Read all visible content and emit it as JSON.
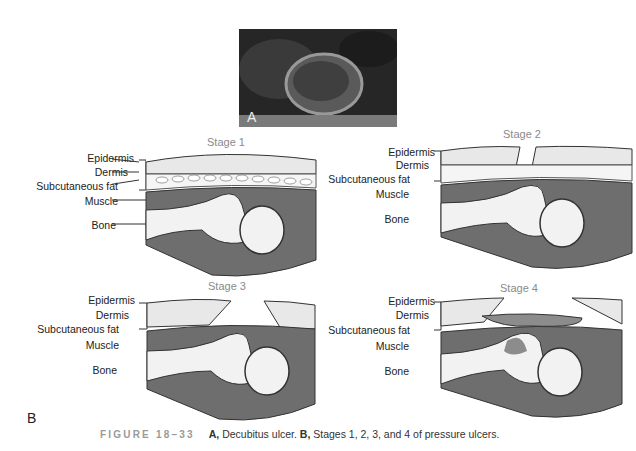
{
  "photo": {
    "label": "A",
    "description": "Decubitus ulcer photograph"
  },
  "stages": [
    {
      "title": "Stage 1"
    },
    {
      "title": "Stage 2"
    },
    {
      "title": "Stage 3"
    },
    {
      "title": "Stage 4"
    }
  ],
  "layer_labels": {
    "epidermis": "Epidermis",
    "dermis": "Dermis",
    "fat": "Subcutaneous fat",
    "muscle": "Muscle",
    "bone": "Bone"
  },
  "panel_b_label": "B",
  "caption": {
    "figure": "FIGURE 18–33",
    "a_label": "A,",
    "a_text": " Decubitus ulcer. ",
    "b_label": "B,",
    "b_text": " Stages 1, 2, 3, and 4 of pressure ulcers."
  },
  "colors": {
    "skin": "#e6e6e6",
    "muscle": "#6e6e6e",
    "bone": "#f2f2f2",
    "wound": "#8c8c8c",
    "outline": "#333333"
  }
}
